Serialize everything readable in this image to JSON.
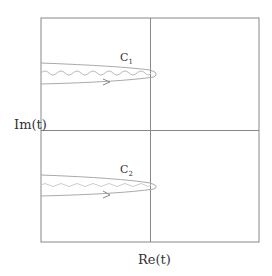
{
  "diagram": {
    "type": "complex-plane-contours",
    "axes": {
      "x_label": "Re(t)",
      "y_label": "Im(t)"
    },
    "contours": [
      {
        "name": "C",
        "subscript": "1",
        "position": "upper half",
        "direction": "right",
        "branch_cut": "wavy line along left"
      },
      {
        "name": "C",
        "subscript": "2",
        "position": "lower half",
        "direction": "right",
        "branch_cut": "wavy line along left"
      }
    ],
    "colors": {
      "frame": "#888888",
      "contour": "#aaaaaa",
      "wavy": "#bbbbbb",
      "text": "#333333"
    }
  }
}
